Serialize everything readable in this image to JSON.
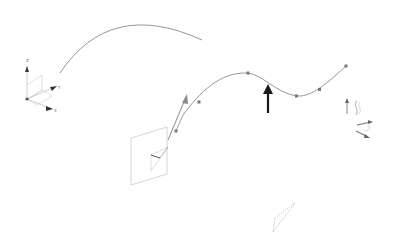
{
  "viewport": {
    "background": "#ffffff",
    "curve_color": "#8a8a8a",
    "dark_arrow_color": "#1a1a1a",
    "construction_color": "#b5b5b5"
  },
  "triad": {
    "labels": {
      "x": "X",
      "y": "Y",
      "z": "Z"
    }
  },
  "spline": {
    "control_point_count": 7
  },
  "manipulator": {
    "description": "move/rotate handle"
  }
}
